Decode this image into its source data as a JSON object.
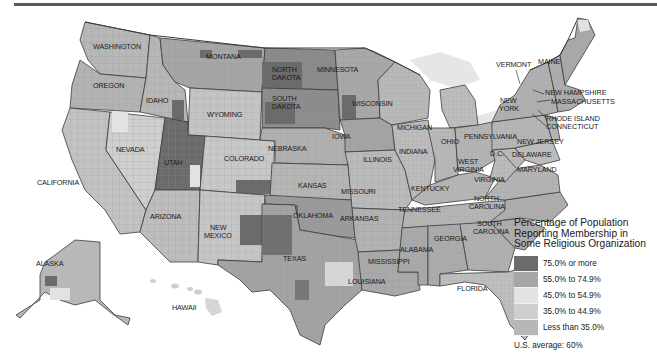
{
  "figure": {
    "type": "choropleth-map"
  },
  "colors": {
    "background": "#ffffff",
    "rule": "#5a5a5a",
    "water_lakes": "#e6e6e6",
    "state_border": "#3a3a3a",
    "bin_75_plus": "#6b6b6b",
    "bin_55_74": "#a6a6a6",
    "bin_45_54": "#e2e2e2",
    "bin_35_44": "#cfcfcf",
    "bin_lt_35": "#b7b7b7"
  },
  "legend": {
    "title_line1": "Percentage of Population",
    "title_line2": "Reporting Membership in",
    "title_line3": "Some Religious Organization",
    "items": [
      {
        "label": "75.0% or more",
        "color": "#6b6b6b"
      },
      {
        "label": "55.0% to 74.9%",
        "color": "#a6a6a6"
      },
      {
        "label": "45.0% to 54.9%",
        "color": "#e2e2e2"
      },
      {
        "label": "35.0% to 44.9%",
        "color": "#cfcfcf"
      },
      {
        "label": "Less than 35.0%",
        "color": "#b7b7b7"
      }
    ],
    "average": "U.S. average: 60%"
  },
  "labels": {
    "washington": "WASHINGTON",
    "oregon": "OREGON",
    "california": "CALIFORNIA",
    "nevada": "NEVADA",
    "idaho": "IDAHO",
    "montana": "MONTANA",
    "wyoming": "WYOMING",
    "utah": "UTAH",
    "arizona": "ARIZONA",
    "colorado": "COLORADO",
    "new_mexico_1": "NEW",
    "new_mexico_2": "MEXICO",
    "north_dakota_1": "NORTH",
    "north_dakota_2": "DAKOTA",
    "south_dakota_1": "SOUTH",
    "south_dakota_2": "DAKOTA",
    "nebraska": "NEBRASKA",
    "kansas": "KANSAS",
    "oklahoma": "OKLAHOMA",
    "texas": "TEXAS",
    "minnesota": "MINNESOTA",
    "iowa": "IOWA",
    "missouri": "MISSOURI",
    "arkansas": "ARKANSAS",
    "louisiana": "LOUISIANA",
    "wisconsin": "WISCONSIN",
    "illinois": "ILLINOIS",
    "michigan": "MICHIGAN",
    "indiana": "INDIANA",
    "ohio": "OHIO",
    "kentucky": "KENTUCKY",
    "tennessee": "TENNESSEE",
    "mississippi": "MISSISSIPPI",
    "alabama": "ALABAMA",
    "georgia": "GEORGIA",
    "florida": "FLORIDA",
    "south_carolina_1": "SOUTH",
    "south_carolina_2": "CAROLINA",
    "north_carolina_1": "NORTH",
    "north_carolina_2": "CAROLINA",
    "virginia": "VIRGINIA",
    "west_virginia_1": "WEST",
    "west_virginia_2": "VIRGINIA",
    "pennsylvania": "PENNSYLVANIA",
    "new_york_1": "NEW",
    "new_york_2": "YORK",
    "vermont": "VERMONT",
    "maine": "MAINE",
    "new_hampshire": "NEW HAMPSHIRE",
    "massachusetts": "MASSACHUSETTS",
    "rhode_island": "RHODE ISLAND",
    "connecticut": "CONNECTICUT",
    "new_jersey": "NEW JERSEY",
    "delaware": "DELAWARE",
    "maryland": "MARYLAND",
    "dc": "D.C.",
    "alaska": "ALASKA",
    "hawaii": "HAWAII"
  }
}
